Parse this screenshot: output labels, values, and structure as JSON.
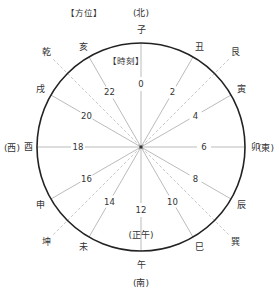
{
  "headers": {
    "direction_header": "【方位】",
    "time_header": "【時刻】"
  },
  "colors": {
    "circle": "#222222",
    "hour_line": "#aaaaaa",
    "direction_line": "#bbbbbb",
    "text": "#333333",
    "center": "#333333"
  },
  "geometry": {
    "cx": 141,
    "cy": 147,
    "r": 104
  },
  "cardinals": {
    "north": "(北)",
    "east": "(東)",
    "south": "(南)",
    "west": "(西)",
    "noon": "(正午)"
  },
  "zodiac": [
    {
      "label": "子",
      "angle": 0
    },
    {
      "label": "丑",
      "angle": 30
    },
    {
      "label": "寅",
      "angle": 60
    },
    {
      "label": "卯",
      "angle": 90
    },
    {
      "label": "辰",
      "angle": 120
    },
    {
      "label": "巳",
      "angle": 150
    },
    {
      "label": "午",
      "angle": 180
    },
    {
      "label": "未",
      "angle": 210
    },
    {
      "label": "申",
      "angle": 240
    },
    {
      "label": "酉",
      "angle": 270
    },
    {
      "label": "戌",
      "angle": 300
    },
    {
      "label": "亥",
      "angle": 330
    }
  ],
  "trigrams": [
    {
      "label": "艮",
      "angle": 45
    },
    {
      "label": "巽",
      "angle": 135
    },
    {
      "label": "坤",
      "angle": 225
    },
    {
      "label": "乾",
      "angle": 315
    }
  ],
  "hours": [
    {
      "label": "0",
      "angle": 0
    },
    {
      "label": "2",
      "angle": 30
    },
    {
      "label": "4",
      "angle": 60
    },
    {
      "label": "6",
      "angle": 90
    },
    {
      "label": "8",
      "angle": 120
    },
    {
      "label": "10",
      "angle": 150
    },
    {
      "label": "12",
      "angle": 180
    },
    {
      "label": "14",
      "angle": 210
    },
    {
      "label": "16",
      "angle": 240
    },
    {
      "label": "18",
      "angle": 270
    },
    {
      "label": "20",
      "angle": 300
    },
    {
      "label": "22",
      "angle": 330
    }
  ]
}
